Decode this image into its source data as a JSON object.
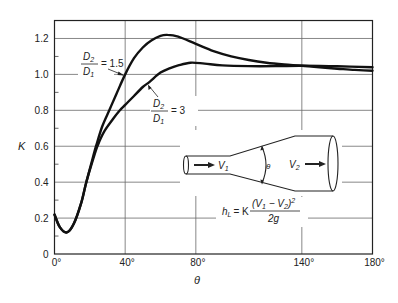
{
  "chart_data": {
    "type": "line",
    "title": "",
    "xlabel": "θ",
    "ylabel": "K",
    "xlim": [
      0,
      180
    ],
    "ylim": [
      0,
      1.3
    ],
    "grid": true,
    "x_ticks": [
      0,
      40,
      80,
      140,
      180
    ],
    "x_tick_labels": [
      "0°",
      "40°",
      "80°",
      "140°",
      "180°"
    ],
    "y_ticks": [
      0,
      0.2,
      0.4,
      0.6,
      0.8,
      1.0,
      1.2
    ],
    "y_tick_labels": [
      "0",
      "0.2",
      "0.4",
      "0.6",
      "0.8",
      "1.0",
      "1.2"
    ],
    "series": [
      {
        "name": "D2/D1 = 1.5",
        "label_num": "D",
        "label_sub_num": "2",
        "label_den": "D",
        "label_sub_den": "1",
        "label_value": "= 1.5",
        "x": [
          0,
          3,
          7,
          11,
          15,
          18,
          21,
          23.5,
          27,
          31,
          35,
          40,
          45,
          50,
          55,
          60,
          64,
          70,
          80,
          90,
          100,
          110,
          120,
          130,
          140,
          150,
          160,
          170,
          180
        ],
        "y": [
          0.22,
          0.15,
          0.12,
          0.17,
          0.28,
          0.4,
          0.51,
          0.6,
          0.71,
          0.8,
          0.89,
          1.0,
          1.09,
          1.15,
          1.19,
          1.215,
          1.22,
          1.21,
          1.17,
          1.13,
          1.1,
          1.08,
          1.065,
          1.055,
          1.048,
          1.04,
          1.032,
          1.025,
          1.02
        ]
      },
      {
        "name": "D2/D1 = 3",
        "label_num": "D",
        "label_sub_num": "2",
        "label_den": "D",
        "label_sub_den": "1",
        "label_value": "= 3",
        "x": [
          0,
          3,
          7,
          11,
          15,
          18,
          21,
          24.3,
          28,
          33,
          37,
          40,
          45,
          50,
          54,
          60,
          65.5,
          70,
          77,
          85,
          95,
          110,
          125,
          140,
          160,
          180
        ],
        "y": [
          0.22,
          0.15,
          0.12,
          0.17,
          0.28,
          0.4,
          0.5,
          0.6,
          0.68,
          0.75,
          0.8,
          0.83,
          0.88,
          0.93,
          0.96,
          1.01,
          1.035,
          1.05,
          1.065,
          1.06,
          1.05,
          1.046,
          1.046,
          1.048,
          1.045,
          1.04
        ]
      }
    ],
    "annotations": {
      "formula_lhs": "h",
      "formula_lhs_sub": "L",
      "formula_eq": "= K",
      "formula_num_open": "(V",
      "formula_num_sub1": "1",
      "formula_num_mid": " − V",
      "formula_num_sub2": "2",
      "formula_num_close": ")",
      "formula_num_exp": "2",
      "formula_den": "2g",
      "v1_label": "V",
      "v1_sub": "1",
      "v2_label": "V",
      "v2_sub": "2",
      "angle_label": "θ"
    }
  }
}
